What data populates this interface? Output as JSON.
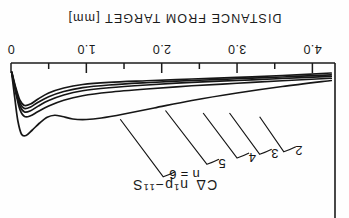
{
  "figure": {
    "axis_title": "DISTANCE FROM TARGET [mm]",
    "series_label_prefix": "C",
    "series_label_delta": "Δ",
    "series_label_rest": "n¹p−¹¹S",
    "rotation_note": "180",
    "ink_color": "#1b1b1b",
    "paper_color": "#fefefe"
  },
  "chart_data": {
    "type": "line",
    "xlabel": "DISTANCE FROM TARGET [mm]",
    "ylabel": "",
    "xlim": [
      0,
      4.3
    ],
    "ylim": [
      0,
      1
    ],
    "grid": false,
    "legend": "inline-curve-labels",
    "orientation": "inverted-180deg",
    "x_ticks_major": [
      0,
      1.0,
      2.0,
      3.0,
      4.0
    ],
    "x_tick_labels": [
      "0",
      "1.0",
      "2.0",
      "3.0",
      "4.0"
    ],
    "x_ticks_minor": [
      0.5,
      1.5,
      2.5,
      3.5
    ],
    "annotations": [
      {
        "text": "2",
        "x": 3.82,
        "y": 0.3
      },
      {
        "text": "3",
        "x": 3.5,
        "y": 0.28
      },
      {
        "text": "4",
        "x": 3.2,
        "y": 0.25
      },
      {
        "text": "5",
        "x": 2.8,
        "y": 0.2
      },
      {
        "text": "n = 6",
        "x": 2.3,
        "y": 0.11
      }
    ],
    "series": [
      {
        "name": "2",
        "values": [
          [
            4.25,
            0.92
          ],
          [
            3.6,
            0.9
          ],
          [
            3.0,
            0.885
          ],
          [
            2.4,
            0.872
          ],
          [
            1.8,
            0.858
          ],
          [
            1.3,
            0.845
          ],
          [
            0.95,
            0.828
          ],
          [
            0.7,
            0.8
          ],
          [
            0.5,
            0.76
          ],
          [
            0.36,
            0.712
          ],
          [
            0.26,
            0.672
          ],
          [
            0.18,
            0.66
          ],
          [
            0.12,
            0.7
          ],
          [
            0.07,
            0.79
          ],
          [
            0.03,
            0.88
          ],
          [
            0.01,
            0.93
          ]
        ]
      },
      {
        "name": "3",
        "values": [
          [
            4.25,
            0.905
          ],
          [
            3.6,
            0.888
          ],
          [
            3.0,
            0.874
          ],
          [
            2.4,
            0.86
          ],
          [
            1.8,
            0.842
          ],
          [
            1.3,
            0.824
          ],
          [
            0.95,
            0.803
          ],
          [
            0.7,
            0.772
          ],
          [
            0.5,
            0.73
          ],
          [
            0.36,
            0.686
          ],
          [
            0.26,
            0.648
          ],
          [
            0.18,
            0.636
          ],
          [
            0.12,
            0.678
          ],
          [
            0.07,
            0.775
          ],
          [
            0.03,
            0.872
          ],
          [
            0.01,
            0.928
          ]
        ]
      },
      {
        "name": "4",
        "values": [
          [
            4.25,
            0.893
          ],
          [
            3.6,
            0.876
          ],
          [
            3.0,
            0.86
          ],
          [
            2.4,
            0.845
          ],
          [
            1.8,
            0.824
          ],
          [
            1.3,
            0.802
          ],
          [
            0.95,
            0.778
          ],
          [
            0.7,
            0.744
          ],
          [
            0.5,
            0.7
          ],
          [
            0.36,
            0.655
          ],
          [
            0.26,
            0.618
          ],
          [
            0.18,
            0.608
          ],
          [
            0.12,
            0.655
          ],
          [
            0.07,
            0.76
          ],
          [
            0.03,
            0.865
          ],
          [
            0.01,
            0.925
          ]
        ]
      },
      {
        "name": "5",
        "values": [
          [
            4.25,
            0.878
          ],
          [
            3.6,
            0.858
          ],
          [
            3.0,
            0.838
          ],
          [
            2.4,
            0.818
          ],
          [
            1.8,
            0.792
          ],
          [
            1.3,
            0.766
          ],
          [
            0.95,
            0.738
          ],
          [
            0.7,
            0.702
          ],
          [
            0.5,
            0.656
          ],
          [
            0.36,
            0.612
          ],
          [
            0.26,
            0.578
          ],
          [
            0.18,
            0.572
          ],
          [
            0.12,
            0.625
          ],
          [
            0.07,
            0.742
          ],
          [
            0.03,
            0.858
          ],
          [
            0.01,
            0.922
          ]
        ]
      },
      {
        "name": "n = 6",
        "values": [
          [
            4.25,
            0.86
          ],
          [
            3.6,
            0.812
          ],
          [
            3.0,
            0.76
          ],
          [
            2.4,
            0.7
          ],
          [
            1.9,
            0.64
          ],
          [
            1.5,
            0.592
          ],
          [
            1.2,
            0.56
          ],
          [
            1.0,
            0.548
          ],
          [
            0.82,
            0.552
          ],
          [
            0.68,
            0.572
          ],
          [
            0.58,
            0.582
          ],
          [
            0.48,
            0.566
          ],
          [
            0.38,
            0.52
          ],
          [
            0.28,
            0.462
          ],
          [
            0.2,
            0.42
          ],
          [
            0.14,
            0.43
          ],
          [
            0.09,
            0.54
          ],
          [
            0.05,
            0.72
          ],
          [
            0.02,
            0.865
          ],
          [
            0.01,
            0.92
          ]
        ]
      }
    ],
    "leader_lines": [
      {
        "label": "2",
        "from": [
          3.78,
          0.33
        ],
        "to": [
          3.3,
          0.57
        ]
      },
      {
        "label": "3",
        "from": [
          3.46,
          0.31
        ],
        "to": [
          2.9,
          0.6
        ]
      },
      {
        "label": "4",
        "from": [
          3.16,
          0.28
        ],
        "to": [
          2.55,
          0.6
        ]
      },
      {
        "label": "5",
        "from": [
          2.76,
          0.23
        ],
        "to": [
          2.05,
          0.62
        ]
      },
      {
        "label": "n = 6",
        "from": [
          2.18,
          0.13
        ],
        "to": [
          1.45,
          0.55
        ]
      }
    ]
  }
}
